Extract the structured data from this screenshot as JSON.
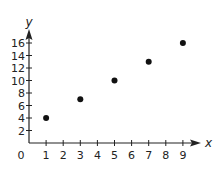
{
  "chart_data": {
    "type": "scatter",
    "title": "",
    "xlabel": "x",
    "ylabel": "y",
    "xlim": [
      0,
      9.5
    ],
    "ylim": [
      0,
      17
    ],
    "grid": false,
    "legend": null,
    "x_ticks": [
      1,
      2,
      3,
      4,
      5,
      6,
      7,
      8,
      9
    ],
    "y_ticks": [
      2,
      4,
      6,
      8,
      10,
      12,
      14,
      16
    ],
    "origin_label": "0",
    "points": [
      {
        "x": 1,
        "y": 4
      },
      {
        "x": 3,
        "y": 7
      },
      {
        "x": 5,
        "y": 10
      },
      {
        "x": 7,
        "y": 13
      },
      {
        "x": 9,
        "y": 16
      }
    ],
    "x": [
      1,
      3,
      5,
      7,
      9
    ],
    "y": [
      4,
      7,
      10,
      13,
      16
    ],
    "colors": {
      "axis": "#222222",
      "point": "#111111",
      "text": "#222222"
    }
  }
}
